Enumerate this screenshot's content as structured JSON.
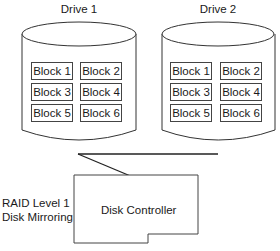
{
  "diagram": {
    "type": "raid-level-1",
    "caption": {
      "line1": "RAID Level 1",
      "line2": "Disk Mirroring"
    },
    "drives": [
      {
        "label": "Drive 1",
        "blocks": [
          "Block 1",
          "Block 2",
          "Block 3",
          "Block 4",
          "Block 5",
          "Block 6"
        ]
      },
      {
        "label": "Drive 2",
        "blocks": [
          "Block 1",
          "Block 2",
          "Block 3",
          "Block 4",
          "Block 5",
          "Block 6"
        ]
      }
    ],
    "controller": {
      "label": "Disk Controller"
    }
  }
}
